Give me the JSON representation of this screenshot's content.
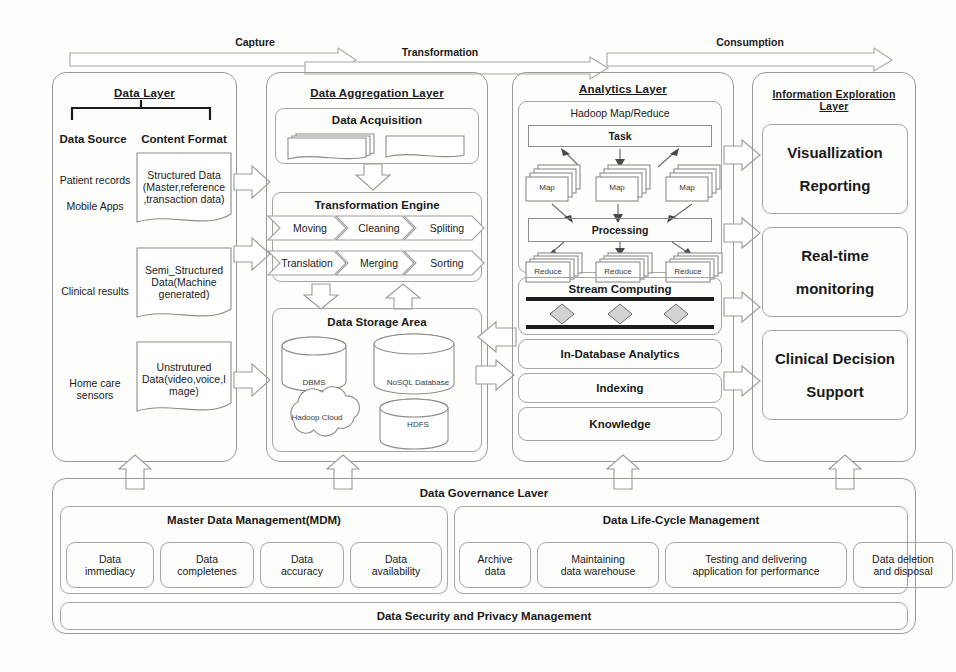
{
  "figure": {
    "bands": [
      {
        "id": "capture",
        "label": "Capture"
      },
      {
        "id": "transformation",
        "label": "Transformation"
      },
      {
        "id": "consumption",
        "label": "Consumption"
      }
    ]
  },
  "data_layer": {
    "title": "Data   Layer",
    "branch_left": "Data Source",
    "branch_right": "Content Format",
    "sources": [
      "Patient records",
      "Mobile Apps",
      "Clinical results",
      "Home care sensors"
    ],
    "formats": [
      "Structured Data (Master,reference ,transaction data)",
      "Semi_Structured Data(Machine generated)",
      "Unstrutured Data(video,voice,Image)"
    ],
    "format_lines": [
      [
        "Structured Data",
        "(Master,reference",
        ",transaction data)"
      ],
      [
        "Semi_Structured",
        "Data(Machine",
        "generated)"
      ],
      [
        "Unstrutured",
        "Data(video,voice,I",
        "mage)"
      ]
    ]
  },
  "aggregation_layer": {
    "title": "Data Aggregation Layer",
    "acquisition": {
      "title": "Data Acquisition"
    },
    "transformation_engine": {
      "title": "Transformation Engine",
      "row1": [
        "Moving",
        "Cleaning",
        "Spliting"
      ],
      "row2": [
        "Translation",
        "Merging",
        "Sorting"
      ]
    },
    "storage": {
      "title": "Data    Storage    Area",
      "stores": [
        "DBMS",
        "NoSQL Database",
        "Hadoop Cloud",
        "HDFS"
      ]
    }
  },
  "analytics_layer": {
    "title": "Analytics      Layer",
    "mapreduce": {
      "title": "Hadoop Map/Reduce",
      "task": "Task",
      "maps": [
        "Map",
        "Map",
        "Map"
      ],
      "processing": "Processing",
      "reduces": [
        "Reduce",
        "Reduce",
        "Reduce"
      ]
    },
    "stream": {
      "title": "Stream Computing"
    },
    "blocks": [
      "In-Database Analytics",
      "Indexing",
      "Knowledge"
    ]
  },
  "exploration_layer": {
    "title_line1": "Information Exploration",
    "title_line2": "Layer",
    "cards": [
      {
        "line1": "Visuallization",
        "line2": "Reporting"
      },
      {
        "line1": "Real-time",
        "line2": "monitoring"
      },
      {
        "line1": "Clinical Decision",
        "line2": "Support"
      }
    ]
  },
  "governance_layer": {
    "title": "Data Governance Laver",
    "mdm": {
      "title": "Master Data Management(MDM)",
      "items": [
        {
          "line1": "Data",
          "line2": "immediacy"
        },
        {
          "line1": "Data",
          "line2": "completenes"
        },
        {
          "line1": "Data",
          "line2": "accuracy"
        },
        {
          "line1": "Data",
          "line2": "availability"
        }
      ]
    },
    "lifecycle": {
      "title": "Data Life-Cycle Management",
      "items": [
        {
          "line1": "Archive",
          "line2": "data"
        },
        {
          "line1": "Maintaining",
          "line2": "data warehouse"
        },
        {
          "line1": "Testing     and     delivering",
          "line2": "application for performance"
        },
        {
          "line1": "Data deletion",
          "line2": "and disposal"
        }
      ]
    },
    "security": "Data Security and Privacy Management"
  },
  "colors": {
    "ink": "#1a1a1a",
    "stroke": "#9a9a97",
    "diamond_fill": "#d2d2d0",
    "bar": "#1c1c1c",
    "page": "#fdfdfc"
  }
}
